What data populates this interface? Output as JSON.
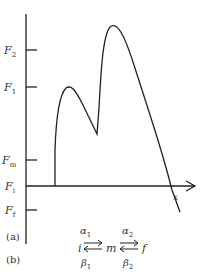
{
  "panel_a": {
    "label": "(a)",
    "y_ticks": [
      {
        "name": "F",
        "sub": "2",
        "y": 50
      },
      {
        "name": "F",
        "sub": "1",
        "y": 87
      },
      {
        "name": "F",
        "sub": "m",
        "y": 160
      },
      {
        "name": "F",
        "sub": "i",
        "y": 186
      },
      {
        "name": "F",
        "sub": "f",
        "y": 210
      }
    ],
    "x_axis_label": "x"
  },
  "panel_b": {
    "label": "(b)",
    "states": [
      "i",
      "m",
      "f"
    ],
    "forward_rates": [
      "α",
      "α"
    ],
    "forward_subs": [
      "1",
      "2"
    ],
    "backward_rates": [
      "β",
      "β"
    ],
    "backward_subs": [
      "1",
      "2"
    ]
  },
  "colors": {
    "line": "#222222",
    "text": "#333333"
  }
}
